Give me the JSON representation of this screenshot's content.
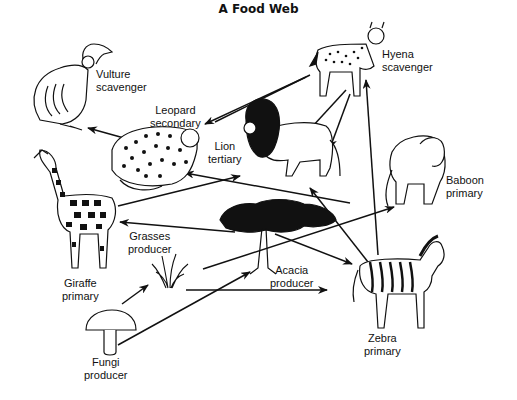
{
  "title": "A Food Web",
  "colors": {
    "line": "#111111",
    "background": "#ffffff",
    "fill_dark": "#111111"
  },
  "organisms": [
    {
      "id": "vulture",
      "name": "Vulture",
      "role": "scavenger"
    },
    {
      "id": "hyena",
      "name": "Hyena",
      "role": "scavenger"
    },
    {
      "id": "leopard",
      "name": "Leopard",
      "role": "secondary"
    },
    {
      "id": "lion",
      "name": "Lion",
      "role": "tertiary"
    },
    {
      "id": "baboon",
      "name": "Baboon",
      "role": "primary"
    },
    {
      "id": "giraffe",
      "name": "Giraffe",
      "role": "primary"
    },
    {
      "id": "grasses",
      "name": "Grasses",
      "role": "producer"
    },
    {
      "id": "acacia",
      "name": "Acacia",
      "role": "producer"
    },
    {
      "id": "zebra",
      "name": "Zebra",
      "role": "primary"
    },
    {
      "id": "fungi",
      "name": "Fungi",
      "role": "producer"
    }
  ],
  "arrows": [
    {
      "from": "leopard",
      "to": "vulture"
    },
    {
      "from": "lion",
      "to": "hyena"
    },
    {
      "from": "hyena",
      "to": "lion"
    },
    {
      "from": "zebra",
      "to": "hyena"
    },
    {
      "from": "giraffe",
      "to": "lion"
    },
    {
      "from": "baboon",
      "to": "leopard"
    },
    {
      "from": "zebra",
      "to": "lion"
    },
    {
      "from": "acacia",
      "to": "giraffe"
    },
    {
      "from": "acacia",
      "to": "zebra"
    },
    {
      "from": "grasses",
      "to": "baboon"
    },
    {
      "from": "grasses",
      "to": "zebra"
    },
    {
      "from": "fungi",
      "to": "grasses"
    },
    {
      "from": "fungi",
      "to": "acacia"
    }
  ]
}
